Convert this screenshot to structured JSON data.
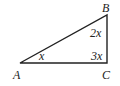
{
  "diagram": {
    "type": "triangle",
    "vertices": [
      {
        "id": "A",
        "label": "A"
      },
      {
        "id": "B",
        "label": "B"
      },
      {
        "id": "C",
        "label": "C"
      }
    ],
    "angles": [
      {
        "vertex": "A",
        "label": "x"
      },
      {
        "vertex": "B",
        "label": "2x"
      },
      {
        "vertex": "C",
        "label": "3x"
      }
    ],
    "stroke_color": "#222222"
  }
}
